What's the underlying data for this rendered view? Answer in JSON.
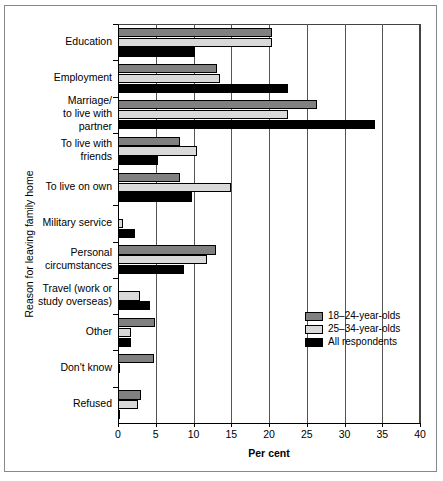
{
  "chart_data": {
    "type": "bar",
    "orientation": "horizontal",
    "title": "",
    "xlabel": "Per cent",
    "ylabel": "Reason for leaving family home",
    "xlim": [
      0,
      40
    ],
    "xticks": [
      0,
      5,
      10,
      15,
      20,
      25,
      30,
      35,
      40
    ],
    "grid": true,
    "legend_position": "center-right",
    "categories": [
      "Education",
      "Employment",
      "Marriage/\nto live with\npartner",
      "To live with\nfriends",
      "To live on own",
      "Military service",
      "Personal\ncircumstances",
      "Travel (work or\nstudy overseas)",
      "Other",
      "Don't know",
      "Refused"
    ],
    "category_labels": [
      [
        "Education"
      ],
      [
        "Employment"
      ],
      [
        "Marriage/",
        "to live with",
        "partner"
      ],
      [
        "To live with",
        "friends"
      ],
      [
        "To live on own"
      ],
      [
        "Military service"
      ],
      [
        "Personal",
        "circumstances"
      ],
      [
        "Travel (work or",
        "study overseas)"
      ],
      [
        "Other"
      ],
      [
        "Don't know"
      ],
      [
        "Refused"
      ]
    ],
    "series": [
      {
        "name": "18–24-year-olds",
        "color": "#808080",
        "values": [
          20.4,
          13.1,
          26.4,
          8.2,
          8.2,
          0.0,
          13.0,
          0.0,
          4.9,
          4.8,
          3.1
        ]
      },
      {
        "name": "25–34-year-olds",
        "color": "#d9d9d9",
        "values": [
          20.4,
          13.5,
          22.5,
          10.5,
          15.0,
          0.7,
          11.8,
          2.9,
          1.7,
          0.2,
          2.6
        ]
      },
      {
        "name": "All respondents",
        "color": "#000000",
        "values": [
          10.2,
          22.5,
          34.0,
          5.3,
          9.8,
          2.2,
          8.8,
          4.2,
          1.7,
          0.0,
          0.1
        ]
      }
    ]
  },
  "legend": {
    "items": [
      {
        "label": "18–24-year-olds",
        "swatch": "s0"
      },
      {
        "label": "25–34-year-olds",
        "swatch": "s1"
      },
      {
        "label": "All respondents",
        "swatch": "s2"
      }
    ]
  },
  "axis": {
    "x_title": "Per cent",
    "y_title": "Reason for leaving family home",
    "x_tick_labels": [
      "0",
      "5",
      "10",
      "15",
      "20",
      "25",
      "30",
      "35",
      "40"
    ]
  }
}
